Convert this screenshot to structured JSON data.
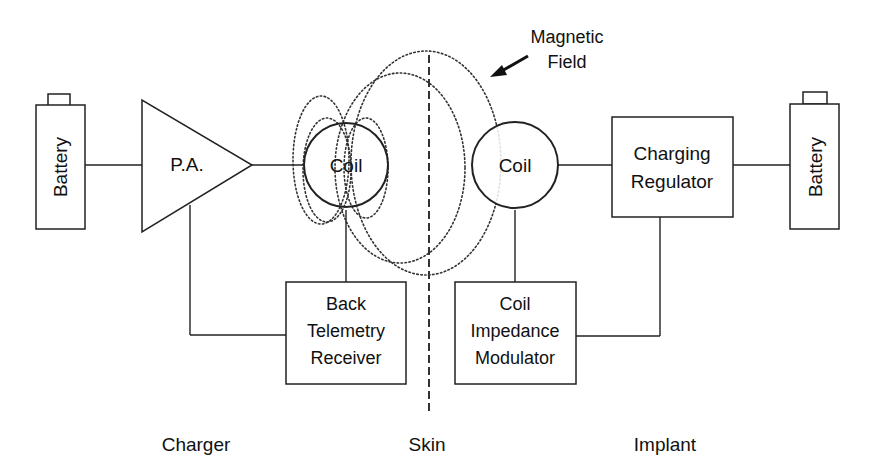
{
  "diagram": {
    "blocks": {
      "charger_battery": "Battery",
      "power_amplifier": "P.A.",
      "external_coil": "Coil",
      "back_telemetry": [
        "Back",
        "Telemetry",
        "Receiver"
      ],
      "implant_coil": "Coil",
      "coil_modulator": [
        "Coil",
        "Impedance",
        "Modulator"
      ],
      "charging_regulator": [
        "Charging",
        "Regulator"
      ],
      "implant_battery": "Battery"
    },
    "annotation": {
      "line1": "Magnetic",
      "line2": "Field"
    },
    "section_labels": {
      "charger": "Charger",
      "skin": "Skin",
      "implant": "Implant"
    }
  }
}
